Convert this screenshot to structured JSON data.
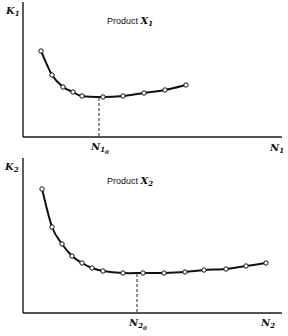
{
  "chart_data": [
    {
      "type": "line",
      "title": "Product X1",
      "title_text": "Product",
      "title_var": "X",
      "title_sub": "1",
      "xlabel": "N1",
      "ylabel": "K1",
      "xlabel_var": "N",
      "xlabel_sub": "1",
      "ylabel_var": "K",
      "ylabel_sub": "1",
      "marker_label": "N10",
      "marker_var": "N",
      "marker_sub": "1",
      "marker_subsub": "0",
      "grid": false,
      "legend": null,
      "markers": "open circles",
      "description": "U-shaped cost curve; minimum K1 at N1 = N10",
      "points_px": [
        [
          41,
          51
        ],
        [
          52,
          75
        ],
        [
          63,
          87
        ],
        [
          73,
          92
        ],
        [
          82,
          96
        ],
        [
          103,
          97
        ],
        [
          123,
          96
        ],
        [
          144,
          93
        ],
        [
          165,
          90
        ],
        [
          186,
          85
        ]
      ],
      "minimum_x_px": 99
    },
    {
      "type": "line",
      "title": "Product X2",
      "title_text": "Product",
      "title_var": "X",
      "title_sub": "2",
      "xlabel": "N2",
      "ylabel": "K2",
      "xlabel_var": "N",
      "xlabel_sub": "2",
      "ylabel_var": "K",
      "ylabel_sub": "2",
      "marker_label": "N20",
      "marker_var": "N",
      "marker_sub": "2",
      "marker_subsub": "0",
      "grid": false,
      "legend": null,
      "markers": "open circles",
      "description": "U-shaped cost curve, flatter minimum; minimum K2 at N2 = N20",
      "points_px": [
        [
          42,
          189
        ],
        [
          52,
          227
        ],
        [
          62,
          244
        ],
        [
          72,
          256
        ],
        [
          82,
          263
        ],
        [
          92,
          268
        ],
        [
          103,
          271
        ],
        [
          123,
          273
        ],
        [
          143,
          273
        ],
        [
          164,
          273
        ],
        [
          185,
          272
        ],
        [
          204,
          270
        ],
        [
          226,
          269
        ],
        [
          246,
          266
        ],
        [
          266,
          263
        ]
      ],
      "minimum_x_px": 137
    }
  ]
}
